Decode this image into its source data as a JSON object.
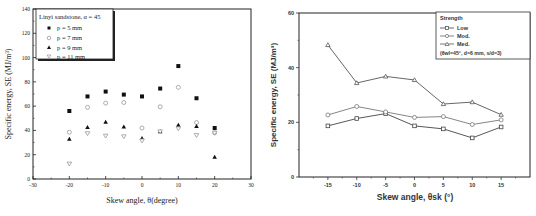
{
  "chart_data": [
    {
      "type": "scatter",
      "title": "",
      "xlabel": "Skew angle, θ(degree)",
      "ylabel": "Specific energy, SE (MJ/m³)",
      "xlim": [
        -30,
        30
      ],
      "ylim": [
        0,
        140
      ],
      "xticks": [
        -30,
        -20,
        -10,
        0,
        10,
        20,
        30
      ],
      "yticks": [
        0,
        20,
        40,
        60,
        80,
        100,
        120,
        140
      ],
      "grid": false,
      "legend_position": "upper left",
      "legend_title": "Linyi sandstone, α = 45",
      "x": [
        -20,
        -15,
        -10,
        -5,
        0,
        5,
        10,
        15,
        20
      ],
      "series": [
        {
          "name": "p = 5 mm",
          "marker": "filled-square",
          "values": [
            56,
            68,
            72,
            69.5,
            68,
            74.5,
            93,
            66.5,
            42
          ]
        },
        {
          "name": "p = 7 mm",
          "marker": "open-circle",
          "values": [
            38.5,
            59,
            62.5,
            63,
            42,
            59.5,
            75.5,
            46.5,
            38
          ]
        },
        {
          "name": "p = 9 mm",
          "marker": "filled-triangle-up",
          "values": [
            33,
            42.5,
            47,
            43,
            33.5,
            39,
            44.5,
            43.5,
            18
          ]
        },
        {
          "name": "p = 11 mm",
          "marker": "open-triangle-down",
          "values": [
            12.5,
            37.5,
            35.5,
            35,
            31.5,
            39,
            41.5,
            36,
            38
          ]
        }
      ]
    },
    {
      "type": "line",
      "title": "",
      "xlabel": "Skew angle, θsk (°)",
      "ylabel": "Specific energy, SE (MJ/m³)",
      "xlim": [
        -20,
        20
      ],
      "ylim": [
        0,
        60
      ],
      "xticks": [
        -15,
        -10,
        -5,
        0,
        5,
        10,
        15
      ],
      "yticks": [
        0,
        20,
        40,
        60
      ],
      "grid": false,
      "legend_position": "upper right",
      "legend_title": "Strength",
      "legend_note": "(θwl=45°, d=6 mm, s/d=3)",
      "x": [
        -15,
        -10,
        -5,
        0,
        5,
        10,
        15
      ],
      "series": [
        {
          "name": "Low",
          "marker": "open-square",
          "values": [
            18.7,
            21.4,
            23.2,
            18.7,
            17.6,
            14.3,
            18.3
          ]
        },
        {
          "name": "Mod.",
          "marker": "open-circle",
          "values": [
            22.7,
            25.8,
            23.8,
            21.8,
            22.1,
            19.2,
            20.9
          ]
        },
        {
          "name": "Med.",
          "marker": "open-triangle-up",
          "values": [
            48.3,
            34.4,
            36.8,
            35.5,
            26.7,
            27.4,
            22.8
          ]
        }
      ]
    }
  ],
  "left": {
    "xlabel": "Skew angle, θ(degree)",
    "ylabel": "Specific energy, SE (MJ/m³)",
    "legend_title": "Linyi sandstone, α = 45",
    "legend": [
      "p = 5 mm",
      "p = 7 mm",
      "p = 9 mm",
      "p = 11 mm"
    ]
  },
  "right": {
    "xlabel": "Skew angle, θsk (°)",
    "ylabel": "Specific energy, SE (MJ/m³)",
    "legend_title": "Strength",
    "legend": [
      "Low",
      "Mod.",
      "Med."
    ],
    "legend_note": "(θwl=45°, d=6 mm, s/d=3)"
  }
}
